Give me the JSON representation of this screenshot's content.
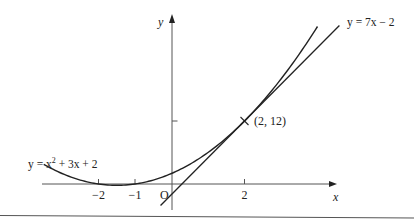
{
  "figure": {
    "y_axis_label": "y",
    "x_axis_label": "x",
    "origin_label": "O",
    "x_ticks": [
      {
        "value": -2,
        "label": "−2"
      },
      {
        "value": -1,
        "label": "−1"
      },
      {
        "value": 2,
        "label": "2"
      }
    ],
    "y_ticks": [
      {
        "value": 12,
        "label": ""
      }
    ],
    "curve": {
      "label_prefix": "y = x",
      "label_sup": "2",
      "label_suffix": " + 3x + 2",
      "equation": "y = x^2 + 3x + 2",
      "x_range": [
        -3.5,
        4.0
      ]
    },
    "tangent": {
      "label": "y = 7x − 2",
      "equation": "y = 7x - 2",
      "x_range": [
        -0.3,
        4.6
      ]
    },
    "point": {
      "x": 2,
      "y": 12,
      "label": "(2, 12)"
    },
    "colors": {
      "line": "#222222",
      "axis": "#555555"
    }
  }
}
